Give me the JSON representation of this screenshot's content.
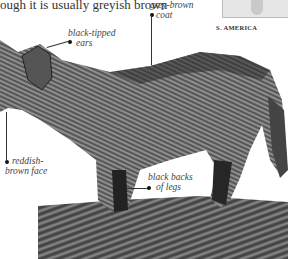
{
  "intro": {
    "text": "ough it is usually greyish brown"
  },
  "map": {
    "caption": "S. AMERICA"
  },
  "annotations": [
    {
      "id": "ears",
      "line1": "black-tipped",
      "line2": "ears"
    },
    {
      "id": "coat",
      "line1": "grey-brown",
      "line2": "coat"
    },
    {
      "id": "face",
      "line1": "reddish-",
      "line2": "brown face"
    },
    {
      "id": "legs",
      "line1": "black backs",
      "line2": "of legs"
    }
  ],
  "photo": {
    "subject": "fox-photo",
    "tone": "greyscale"
  },
  "colors": {
    "fur_dark": "#3a3a3a",
    "fur_mid": "#7a7a7a",
    "fur_light": "#b5b5b5",
    "ground": "#6b6b6b"
  }
}
